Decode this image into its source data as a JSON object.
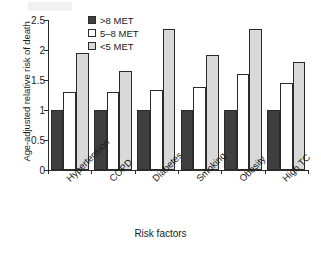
{
  "chart_data": {
    "type": "bar",
    "title": "",
    "xlabel": "Risk factors",
    "ylabel": "Age-adjusted relative risk of death",
    "categories": [
      "Hypertension",
      "COPD",
      "Diabetes",
      "Smoking",
      "Obesity",
      "High TC"
    ],
    "series": [
      {
        "name": ">8 MET",
        "color": "#3f3f3f",
        "values": [
          1.0,
          1.0,
          1.0,
          1.0,
          1.0,
          1.0
        ]
      },
      {
        "name": "5–8 MET",
        "color": "#ffffff",
        "values": [
          1.3,
          1.3,
          1.33,
          1.38,
          1.6,
          1.45
        ]
      },
      {
        "name": "<5 MET",
        "color": "#d9d9d9",
        "values": [
          1.95,
          1.65,
          2.35,
          1.92,
          2.35,
          1.8
        ]
      }
    ],
    "ylim": [
      0,
      2.5
    ],
    "yticks": [
      0,
      0.5,
      1,
      1.5,
      2,
      2.5
    ],
    "ytick_labels": [
      "0",
      "0.5",
      "1",
      "1.5",
      "2",
      "2.5"
    ],
    "grid": false,
    "legend_position": "top-center",
    "legend_entries": [
      ">8 MET",
      "5–8 MET",
      "<5 MET"
    ]
  }
}
